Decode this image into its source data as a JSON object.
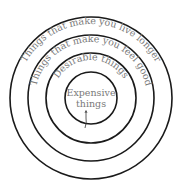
{
  "diagram": {
    "type": "concentric-circles",
    "rings": [
      {
        "label": "Things that make you live longer",
        "level": 1
      },
      {
        "label": "Things that make you feel good",
        "level": 2
      },
      {
        "label": "Desirable things",
        "level": 3
      },
      {
        "label_line1": "Expensive",
        "label_line2": "things",
        "level": 4
      }
    ]
  }
}
